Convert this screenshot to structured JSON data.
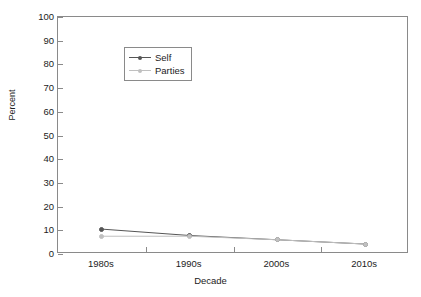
{
  "chart_data": {
    "type": "line",
    "title": "",
    "xlabel": "Decade",
    "ylabel": "Percent",
    "categories": [
      "1980s",
      "1990s",
      "2000s",
      "2010s"
    ],
    "series": [
      {
        "name": "Self",
        "values": [
          10.5,
          7.8,
          6.0,
          4.2
        ],
        "color": "#555555"
      },
      {
        "name": "Parties",
        "values": [
          7.5,
          7.5,
          6.0,
          4.2
        ],
        "color": "#c0c0c0"
      }
    ],
    "ylim": [
      0,
      100
    ],
    "yticks": [
      0,
      10,
      20,
      30,
      40,
      50,
      60,
      70,
      80,
      90,
      100
    ],
    "ytick_labels": [
      "0",
      "10",
      "20",
      "30",
      "40",
      "50",
      "60",
      "70",
      "80",
      "90",
      "100"
    ],
    "grid": false,
    "legend_position": "upper-left",
    "legend_entries": [
      "Self",
      "Parties"
    ],
    "axis_color": "#8a8a8a",
    "background": "#ffffff"
  },
  "figure": {
    "y_axis_title": "Percent",
    "x_axis_title": "Decade"
  }
}
